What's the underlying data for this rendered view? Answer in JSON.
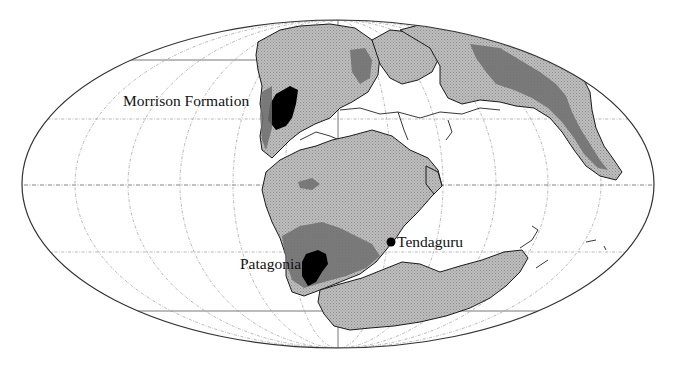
{
  "map": {
    "projection": "mollweide",
    "ellipse": {
      "cx": 338,
      "cy": 184,
      "rx": 316,
      "ry": 164
    },
    "colors": {
      "ocean": "#ffffff",
      "land": "#b9b9b9",
      "upland": "#6f6f6f",
      "fossil_site": "#000000",
      "outline": "#1a1a1a",
      "graticule": "#9a9a9a"
    },
    "graticule": {
      "meridian_spacing_deg": 30,
      "parallels_y": [
        60,
        119,
        186,
        252,
        311
      ]
    }
  },
  "labels": {
    "morrison": "Morrison Formation",
    "patagonia": "Patagonia",
    "tendaguru": "Tendaguru"
  },
  "sites": [
    {
      "name": "Morrison Formation",
      "type": "fossil-area"
    },
    {
      "name": "Patagonia",
      "type": "fossil-area"
    },
    {
      "name": "Tendaguru",
      "type": "fossil-point"
    }
  ]
}
